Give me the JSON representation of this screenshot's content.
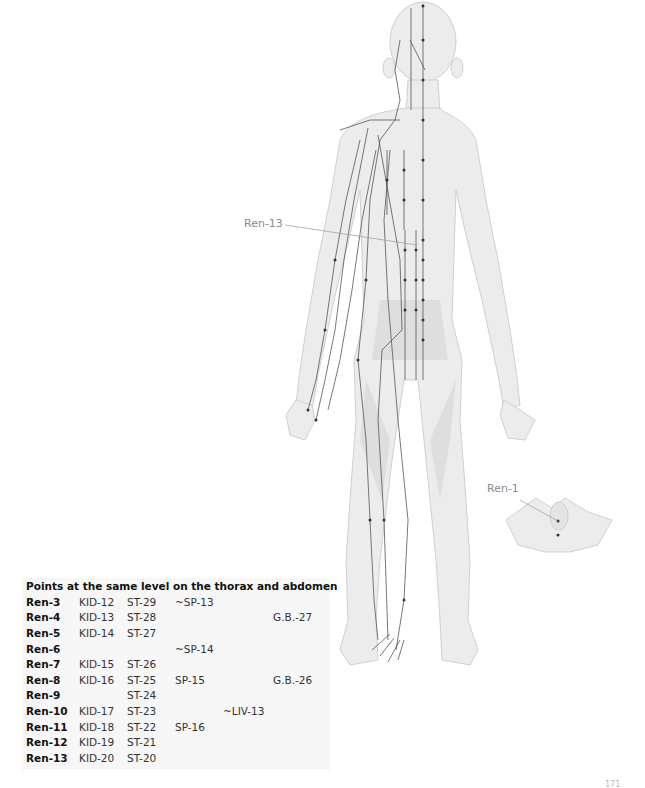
{
  "figure": {
    "labels": {
      "ren13": "Ren-13",
      "ren1": "Ren-1"
    },
    "colors": {
      "body_fill": "#ececec",
      "body_shade": "#dcdcdc",
      "channel_line": "#555555",
      "point": "#333333",
      "label_line": "#9a9a9a"
    }
  },
  "table": {
    "title": "Points at the same level on the thorax and abdomen",
    "rows": [
      [
        "Ren-3",
        "KID-12",
        "ST-29",
        "~SP-13",
        "",
        ""
      ],
      [
        "Ren-4",
        "KID-13",
        "ST-28",
        "",
        "",
        "G.B.-27"
      ],
      [
        "Ren-5",
        "KID-14",
        "ST-27",
        "",
        "",
        ""
      ],
      [
        "Ren-6",
        "",
        "",
        "~SP-14",
        "",
        ""
      ],
      [
        "Ren-7",
        "KID-15",
        "ST-26",
        "",
        "",
        ""
      ],
      [
        "Ren-8",
        "KID-16",
        "ST-25",
        "SP-15",
        "",
        "G.B.-26"
      ],
      [
        "Ren-9",
        "",
        "ST-24",
        "",
        "",
        ""
      ],
      [
        "Ren-10",
        "KID-17",
        "ST-23",
        "",
        "~LIV-13",
        ""
      ],
      [
        "Ren-11",
        "KID-18",
        "ST-22",
        "SP-16",
        "",
        ""
      ],
      [
        "Ren-12",
        "KID-19",
        "ST-21",
        "",
        "",
        ""
      ],
      [
        "Ren-13",
        "KID-20",
        "ST-20",
        "",
        "",
        ""
      ]
    ]
  },
  "page_number": "171"
}
